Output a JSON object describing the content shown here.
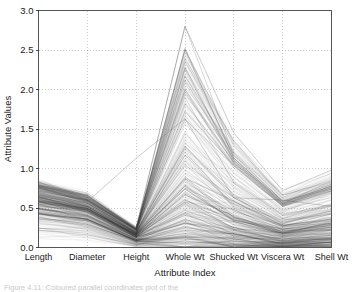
{
  "figure": {
    "background_color": "#ffffff",
    "line_color": "#3a3a3a",
    "grid_color": "#b9b9b9",
    "frame_color": "#555555",
    "caption_fragment": "Figure 4.11: Coloured parallel coordinates plot of the"
  },
  "chart_data": {
    "type": "line",
    "subtype": "parallel-coordinates",
    "title": "",
    "xlabel": "Attribute Index",
    "ylabel": "Attribute Values",
    "categories": [
      "Length",
      "Diameter",
      "Height",
      "Whole Wt",
      "Shucked Wt",
      "Viscera Wt",
      "Shell Wt"
    ],
    "ylim": [
      0.0,
      3.0
    ],
    "yticks": [
      0.0,
      0.5,
      1.0,
      1.5,
      2.0,
      2.5,
      3.0
    ],
    "ytick_labels": [
      "0.0",
      "0.5",
      "1.0",
      "1.5",
      "2.0",
      "2.5",
      "3.0"
    ],
    "grid": true,
    "grid_style": "dotted",
    "legend": "none",
    "line_opacity": 0.16,
    "line_width": 0.45,
    "n_lines": 300,
    "axis_ranges": [
      {
        "name": "Length",
        "min": 0.08,
        "max": 0.82,
        "median": 0.46
      },
      {
        "name": "Diameter",
        "min": 0.06,
        "max": 0.66,
        "median": 0.36
      },
      {
        "name": "Height",
        "min": 0.01,
        "max": 0.25,
        "median": 0.12
      },
      {
        "name": "Whole Wt",
        "min": 0.02,
        "max": 2.8,
        "median": 0.78
      },
      {
        "name": "Shucked Wt",
        "min": 0.01,
        "max": 1.45,
        "median": 0.33
      },
      {
        "name": "Viscera Wt",
        "min": 0.01,
        "max": 0.72,
        "median": 0.17
      },
      {
        "name": "Shell Wt",
        "min": 0.01,
        "max": 1.0,
        "median": 0.23
      }
    ],
    "outlier_series": [
      {
        "name": "height-outlier",
        "values": [
          0.68,
          0.58,
          1.13,
          1.63,
          0.63,
          0.6,
          0.52
        ]
      },
      {
        "name": "max-whole-wt",
        "values": [
          0.82,
          0.66,
          0.25,
          2.8,
          1.45,
          0.72,
          0.98
        ]
      }
    ],
    "series": [
      {
        "name": "q05",
        "values": [
          0.22,
          0.16,
          0.04,
          0.08,
          0.03,
          0.02,
          0.03
        ]
      },
      {
        "name": "q25",
        "values": [
          0.36,
          0.28,
          0.09,
          0.36,
          0.15,
          0.08,
          0.11
        ]
      },
      {
        "name": "q50",
        "values": [
          0.46,
          0.36,
          0.12,
          0.78,
          0.33,
          0.17,
          0.23
        ]
      },
      {
        "name": "q75",
        "values": [
          0.58,
          0.46,
          0.15,
          1.21,
          0.52,
          0.26,
          0.34
        ]
      },
      {
        "name": "q95",
        "values": [
          0.7,
          0.56,
          0.2,
          1.9,
          0.82,
          0.42,
          0.54
        ]
      }
    ]
  }
}
